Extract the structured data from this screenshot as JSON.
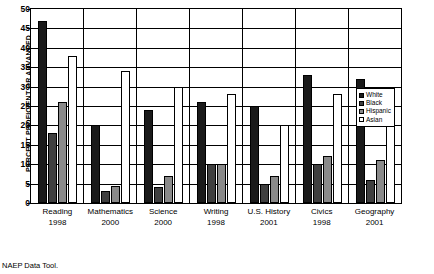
{
  "footer": {
    "text": "NAEP Data Tool."
  },
  "legend": {
    "position": "inside-top-right",
    "items": [
      {
        "label": "White",
        "color": "#1a1a1a"
      },
      {
        "label": "Black",
        "color": "#3f3f3f"
      },
      {
        "label": "Hispanic",
        "color": "#8a8a8a"
      },
      {
        "label": "Asian",
        "color": "#ffffff"
      }
    ]
  },
  "chart_data": {
    "type": "bar",
    "title": "",
    "subtitle": "",
    "xlabel": "",
    "ylabel": "PERCENT PROFICIENT OR ADVANCED",
    "ylim": [
      0,
      50
    ],
    "yticks": [
      0,
      5,
      10,
      15,
      20,
      25,
      30,
      35,
      40,
      45,
      50
    ],
    "grid": true,
    "legend_position": "inside-top-right",
    "categories": [
      "Reading",
      "Mathematics",
      "Science",
      "Writing",
      "U.S. History",
      "Civics",
      "Geography"
    ],
    "category_years": [
      "1998",
      "2000",
      "2000",
      "1998",
      "2001",
      "1998",
      "2001"
    ],
    "series": [
      {
        "name": "White",
        "color": "#1a1a1a",
        "values": [
          47,
          20,
          24,
          26,
          25,
          33,
          32
        ]
      },
      {
        "name": "Black",
        "color": "#3f3f3f",
        "values": [
          18,
          3,
          4,
          10,
          5,
          10,
          6
        ]
      },
      {
        "name": "Hispanic",
        "color": "#8a8a8a",
        "values": [
          26,
          4.5,
          7,
          10,
          7,
          12,
          11
        ]
      },
      {
        "name": "Asian",
        "color": "#ffffff",
        "values": [
          38,
          34,
          30,
          28,
          20,
          28,
          27
        ]
      }
    ]
  }
}
